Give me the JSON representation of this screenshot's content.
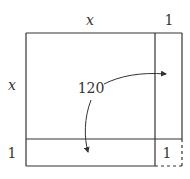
{
  "diagram": {
    "labels": {
      "top_x": "x",
      "top_one": "1",
      "left_x": "x",
      "left_one": "1",
      "center_value": "120",
      "corner_one": "1"
    },
    "colors": {
      "stroke": "#333333",
      "background": "#ffffff"
    }
  }
}
